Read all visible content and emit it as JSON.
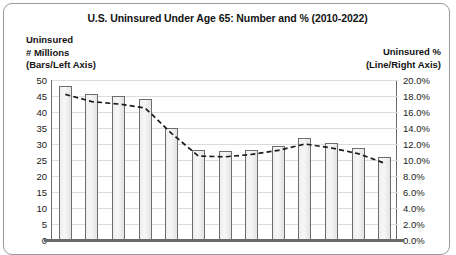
{
  "chart_data": {
    "type": "bar",
    "title": "U.S. Uninsured Under Age 65: Number and % (2010-2022)",
    "categories": [
      "2010",
      "2011",
      "2012",
      "2013",
      "2014",
      "2015",
      "2016",
      "2017",
      "2018",
      "2019",
      "2020",
      "2021",
      "2022"
    ],
    "xlabel": "",
    "left_axis": {
      "label": "Uninsured\n# Millions\n(Bars/Left Axis)",
      "label_line1": "Uninsured",
      "label_line2": "# Millions",
      "label_line3": "(Bars/Left Axis)",
      "ylim": [
        0,
        50
      ],
      "tick_step": 5,
      "ticks": [
        "50",
        "45",
        "40",
        "35",
        "30",
        "25",
        "20",
        "15",
        "10",
        "5",
        "0"
      ]
    },
    "right_axis": {
      "label_line1": "Uninsured %",
      "label_line2": "(Line/Right Axis)",
      "ylim": [
        0,
        20
      ],
      "tick_step": 2,
      "ticks": [
        "20.0%",
        "18.0%",
        "16.0%",
        "14.0%",
        "12.0%",
        "10.0%",
        "8.0%",
        "6.0%",
        "4.0%",
        "2.0%",
        "0.0%"
      ]
    },
    "grid": true,
    "legend": "none",
    "series": [
      {
        "name": "Uninsured # Millions",
        "render": "bar",
        "axis": "left",
        "values": [
          48,
          45.5,
          45,
          44,
          35,
          28,
          27.7,
          28.2,
          29.5,
          32,
          30.2,
          28.8,
          26
        ]
      },
      {
        "name": "Uninsured %",
        "render": "dashed-line",
        "axis": "right",
        "values": [
          18.2,
          17.3,
          17.0,
          16.5,
          13.3,
          10.5,
          10.4,
          10.7,
          11.2,
          12.0,
          11.5,
          10.8,
          9.6
        ]
      }
    ],
    "colors": {
      "bar_fill": "#f1f1f1",
      "bar_border": "#6d6d6d",
      "line": "#1c1c1c",
      "grid": "#dcdcdc",
      "frame": "#9a9a9a",
      "text": "#131313"
    }
  }
}
